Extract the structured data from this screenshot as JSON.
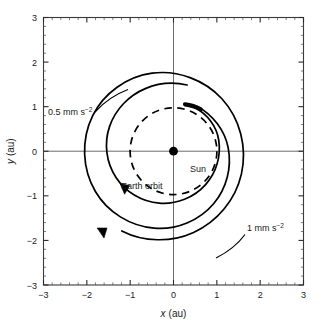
{
  "chart_data": {
    "type": "line",
    "title": "",
    "xlabel": "x (au)",
    "ylabel": "y (au)",
    "xlim": [
      -3,
      3
    ],
    "ylim": [
      -3,
      3
    ],
    "grid": false,
    "legend": "none",
    "x_ticks": [
      "-3",
      "-2",
      "-1",
      "0",
      "1",
      "2",
      "3"
    ],
    "y_ticks": [
      "3",
      "2",
      "1",
      "0",
      "-1",
      "-2",
      "-3"
    ],
    "x_tick_values": [
      -3,
      -2,
      -1,
      0,
      1,
      2,
      3
    ],
    "y_tick_values": [
      3,
      2,
      1,
      0,
      -1,
      -2,
      -3
    ],
    "minor_tick_step": 0.2,
    "units": "au",
    "series": [
      {
        "name": "Earth orbit",
        "style": "dashed",
        "shape": "circle",
        "radius": 1.0,
        "center": [
          0,
          0
        ],
        "color": "#000000"
      },
      {
        "name": "0.5 mm s-2 spiral",
        "style": "solid",
        "shape": "outward-spiral",
        "start": [
          0.5,
          1.0
        ],
        "r_start": 1.1,
        "r_end": 1.55,
        "turns": 1.0,
        "direction": "clockwise",
        "color": "#000000"
      },
      {
        "name": "1 mm s-2 spiral",
        "style": "solid",
        "shape": "outward-spiral",
        "start": [
          0.5,
          1.0
        ],
        "r_start": 1.1,
        "r_end": 2.7,
        "turns": 1.1,
        "direction": "clockwise",
        "color": "#000000"
      }
    ],
    "markers": [
      {
        "name": "Sun",
        "x": 0,
        "y": 0,
        "style": "filled-circle"
      },
      {
        "name": "spacecraft-start",
        "x": 0.5,
        "y": 1.0,
        "style": "thick-arc-segment"
      }
    ],
    "annotations": [
      {
        "text": "Sun",
        "x": 0.3,
        "y": -0.35
      },
      {
        "text": "Earth orbit",
        "x": -1.1,
        "y": -0.75
      },
      {
        "text": "0.5 mm s",
        "exponent": "-2",
        "x": -2.5,
        "y": 0.95
      },
      {
        "text": "1 mm s",
        "exponent": "-2",
        "x": 1.45,
        "y": -1.6
      }
    ]
  },
  "labels": {
    "x_axis_var": "x",
    "x_axis_unit": "(au)",
    "y_axis_var": "y",
    "y_axis_unit": "(au)",
    "sun": "Sun",
    "earth_orbit": "Earth orbit",
    "accel_low_base": "0.5 mm s",
    "accel_low_exp": "−2",
    "accel_high_base": "1 mm s",
    "accel_high_exp": "−2",
    "tick_x_neg3": "−3",
    "tick_x_neg2": "−2",
    "tick_x_neg1": "−1",
    "tick_x_0": "0",
    "tick_x_1": "1",
    "tick_x_2": "2",
    "tick_x_3": "3",
    "tick_y_3": "3",
    "tick_y_2": "2",
    "tick_y_1": "1",
    "tick_y_0": "0",
    "tick_y_neg1": "−1",
    "tick_y_neg2": "−2",
    "tick_y_neg3": "−3"
  },
  "colors": {
    "line": "#000000",
    "frame": "#3a3a3a",
    "axis": "#6b6b6b",
    "text": "#1a1a1a",
    "background": "#ffffff"
  }
}
